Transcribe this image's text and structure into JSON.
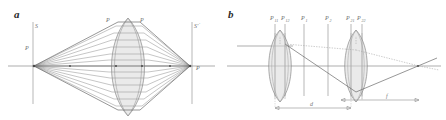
{
  "figure": {
    "panels": [
      {
        "id": "a",
        "label": "a",
        "caption_labels": {
          "left_plane": "S",
          "right_plane": "S'",
          "source_point": "P",
          "image_point": "P",
          "lens_top_left": "P",
          "lens_top_right": "P"
        },
        "description": "Ray bundle from object point P converging through a thick biconvex lens to image point P on plane S'"
      },
      {
        "id": "b",
        "label": "b",
        "principal_plane_labels": [
          "P11",
          "P12",
          "P1",
          "P2",
          "P21",
          "P22"
        ],
        "principal_plane_labels_display": {
          "p11": "P",
          "p11_sub": "11",
          "p12": "P",
          "p12_sub": "12",
          "p1": "P",
          "p1_sub": "1",
          "p2": "P",
          "p2_sub": "2",
          "p21": "P",
          "p21_sub": "21",
          "p22": "P",
          "p22_sub": "22"
        },
        "dimension_labels": {
          "separation": "d",
          "focal": "f"
        },
        "description": "Two thick lenses separated by distance d, with back focal distance f marked by dimension arrows"
      }
    ],
    "colors": {
      "background": "#ffffff",
      "ink": "#2b2b2b",
      "line": "#8a8a8a",
      "lens_fill": "#d8d8d8",
      "label": "#6e6e6e"
    }
  }
}
